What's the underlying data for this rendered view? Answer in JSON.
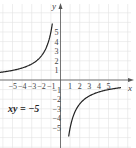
{
  "chart_data": {
    "type": "line",
    "title": "",
    "equation": "xy = −5",
    "function": "y = -5/x",
    "xlabel": "x",
    "ylabel": "y",
    "xlim": [
      -6,
      7
    ],
    "ylim": [
      -6,
      7
    ],
    "grid": true,
    "x_ticks": [
      -5,
      -4,
      -3,
      -2,
      -1,
      1,
      2,
      3,
      4,
      5
    ],
    "x_tick_labels": [
      "−5",
      "−4",
      "−3",
      "−2",
      "−1",
      "1",
      "2",
      "3",
      "4",
      "5"
    ],
    "y_ticks": [
      5,
      4,
      3,
      2,
      1,
      -1,
      -2,
      -3,
      -4,
      -5
    ],
    "y_tick_labels": [
      "5",
      "4",
      "3",
      "2",
      "1",
      "−1",
      "−2",
      "−3",
      "−4",
      "−5"
    ],
    "series": [
      {
        "name": "branch-left",
        "x": [
          -6.3,
          -5,
          -4,
          -3,
          -2,
          -1.5,
          -1,
          -0.85
        ],
        "y": [
          0.79,
          1,
          1.25,
          1.67,
          2.5,
          3.33,
          5,
          5.9
        ]
      },
      {
        "name": "branch-right",
        "x": [
          0.85,
          1,
          1.5,
          2,
          3,
          4,
          5,
          6.3
        ],
        "y": [
          -5.9,
          -5,
          -3.33,
          -2.5,
          -1.67,
          -1.25,
          -1,
          -0.79
        ]
      }
    ],
    "colors": {
      "curve": "#222222",
      "axis": "#555555",
      "grid": "#e2e2e2"
    }
  },
  "labels": {
    "x_axis": "x",
    "y_axis": "y",
    "equation": "xy = −5"
  }
}
